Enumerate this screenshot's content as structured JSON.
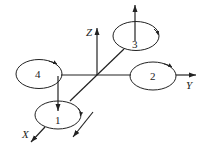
{
  "diagram": {
    "title": "",
    "axes": {
      "x_label": "X",
      "y_label": "Y",
      "z_label": "Z"
    },
    "rotors": [
      {
        "id": "1",
        "label": "1"
      },
      {
        "id": "2",
        "label": "2"
      },
      {
        "id": "3",
        "label": "3"
      },
      {
        "id": "4",
        "label": "4"
      }
    ],
    "colors": {
      "stroke": "#222222",
      "background": "#ffffff"
    }
  }
}
